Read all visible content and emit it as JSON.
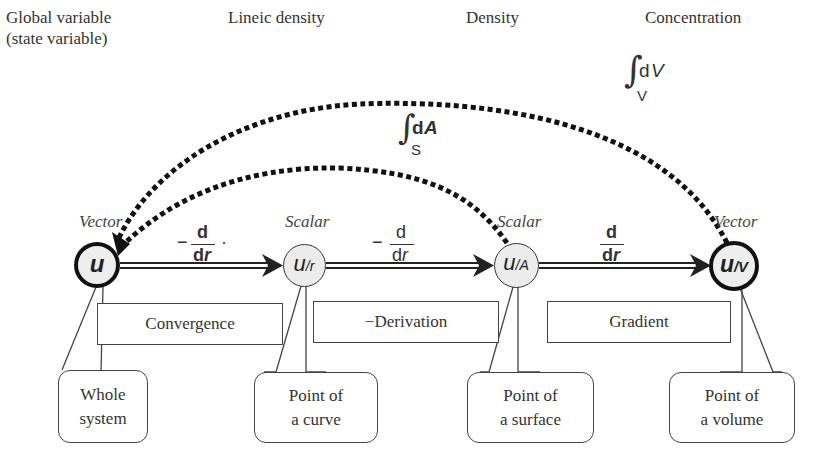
{
  "headers": {
    "global": [
      "Global variable",
      "(state variable)"
    ],
    "lineic": "Lineic density",
    "density": "Density",
    "concentration": "Concentration"
  },
  "integrals": {
    "surface": {
      "symbol": "∫",
      "differential": "d",
      "variable": "A",
      "domain": "S"
    },
    "volume": {
      "symbol": "∫",
      "differential": "d",
      "variable": "V",
      "domain": "V"
    }
  },
  "nodes": [
    {
      "id": "u",
      "base": "u",
      "sub": "",
      "type": "Vector",
      "style": "thick"
    },
    {
      "id": "u_r",
      "base": "u",
      "sub": "/r",
      "type": "Scalar",
      "style": "thin"
    },
    {
      "id": "u_A",
      "base": "u",
      "sub": "/A",
      "type": "Scalar",
      "style": "thin"
    },
    {
      "id": "u_V",
      "base": "u",
      "sub": "/V",
      "type": "Vector",
      "style": "thick"
    }
  ],
  "operators": [
    {
      "sign": "−",
      "num": "d",
      "den_d": "d",
      "den_var": "r",
      "suffix": "·",
      "bold": true
    },
    {
      "sign": "−",
      "num": "d",
      "den_d": "d",
      "den_var": "r",
      "suffix": "",
      "bold": false
    },
    {
      "sign": "",
      "num": "d",
      "den_d": "d",
      "den_var": "r",
      "suffix": "",
      "bold": true
    }
  ],
  "operation_boxes": [
    "Convergence",
    "−Derivation",
    "Gradient"
  ],
  "callouts": [
    [
      "Whole",
      "system"
    ],
    [
      "Point of",
      "a curve"
    ],
    [
      "Point of",
      "a surface"
    ],
    [
      "Point of",
      "a volume"
    ]
  ],
  "colors": {
    "stroke": "#222222",
    "node_fill": "#ececec",
    "text": "#333333"
  }
}
